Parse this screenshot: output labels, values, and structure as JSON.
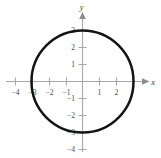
{
  "figure": {
    "title": "",
    "background_color": "#ffffff",
    "width": 161,
    "height": 158
  },
  "axes": {
    "x_name": "x",
    "y_name": "y",
    "axis_color": "#a8a8a8",
    "label_color": "#4a4a4a",
    "curve_color": "#141414"
  },
  "labels": {
    "x_neg4": "−4",
    "x_neg3": "−3",
    "x_neg2": "−2",
    "x_neg1": "−1",
    "x_pos1": "1",
    "x_pos2": "2",
    "y_pos1": "1",
    "y_pos2": "2",
    "y_pos3": "3",
    "y_neg1": "−1",
    "y_neg2": "−2",
    "y_neg3": "−3",
    "y_neg4": "−4"
  },
  "chart_data": {
    "type": "line",
    "title": "",
    "xlabel": "x",
    "ylabel": "y",
    "grid": false,
    "legend": null,
    "xlim": [
      -4.6,
      3.6
    ],
    "ylim": [
      -4.6,
      3.9
    ],
    "xticks": [
      -4,
      -3,
      -2,
      -1,
      1,
      2
    ],
    "yticks": [
      3,
      2,
      1,
      -1,
      -2,
      -3,
      -4
    ],
    "xtick_labels": [
      "−4",
      "−3",
      "−2",
      "−1",
      "1",
      "2"
    ],
    "ytick_labels": [
      "3",
      "2",
      "1",
      "−1",
      "−2",
      "−3",
      "−4"
    ],
    "series": [
      {
        "name": "circle",
        "shape": "circle",
        "center": [
          0,
          0
        ],
        "radius": 3,
        "equation": "x^2 + y^2 = 9",
        "x_intercepts": [
          -3,
          3
        ],
        "y_intercepts": [
          -3,
          3
        ],
        "color": "#141414",
        "linewidth": 2.5
      }
    ]
  }
}
